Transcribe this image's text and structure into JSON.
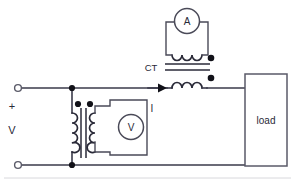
{
  "diagram": {
    "type": "electrical-schematic",
    "background_color": "#ffffff",
    "wire_color": "#3a3a4a",
    "labels": {
      "ammeter": "A",
      "voltmeter": "V",
      "current_transformer": "CT",
      "load": "load",
      "current": "I",
      "polarity_plus": "+",
      "supply_voltage": "V"
    },
    "components": [
      {
        "name": "ammeter",
        "symbol": "A",
        "kind": "meter-circle"
      },
      {
        "name": "voltmeter",
        "symbol": "V",
        "kind": "meter-circle"
      },
      {
        "name": "current-transformer",
        "symbol": "CT",
        "kind": "transformer"
      },
      {
        "name": "potential-transformer",
        "symbol": "",
        "kind": "transformer"
      },
      {
        "name": "load",
        "symbol": "load",
        "kind": "box"
      }
    ],
    "terminals": [
      {
        "name": "positive-terminal",
        "label": "+"
      },
      {
        "name": "negative-terminal",
        "label": ""
      }
    ]
  }
}
